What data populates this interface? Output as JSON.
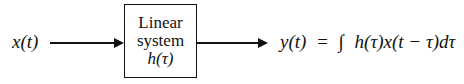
{
  "input": {
    "label": "x(t)"
  },
  "system": {
    "line1": "Linear",
    "line2": "system",
    "line3": "h(τ)"
  },
  "output": {
    "lhs": "y(t)",
    "equals": "=",
    "integral": "∫",
    "rhs": "h(τ)x(t − τ)dτ"
  }
}
